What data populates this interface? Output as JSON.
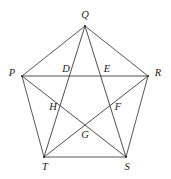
{
  "figure": {
    "type": "geometry-diagram",
    "background_color": "#ffffff",
    "line_color": "#3a3a3a",
    "label_color": "#1c1c1c",
    "width": 171,
    "height": 179,
    "vertices": [
      {
        "label": "Q",
        "x": 85,
        "y": 26,
        "label_x": 85,
        "label_y": 16
      },
      {
        "label": "R",
        "x": 148,
        "y": 76,
        "label_x": 158,
        "label_y": 74
      },
      {
        "label": "S",
        "x": 126,
        "y": 157,
        "label_x": 127,
        "label_y": 168
      },
      {
        "label": "T",
        "x": 44,
        "y": 157,
        "label_x": 45,
        "label_y": 168
      },
      {
        "label": "P",
        "x": 22,
        "y": 76,
        "label_x": 12,
        "label_y": 74
      }
    ],
    "intersections": [
      {
        "label": "D",
        "x": 73,
        "y": 77,
        "label_x": 66,
        "label_y": 70
      },
      {
        "label": "E",
        "x": 100,
        "y": 77,
        "label_x": 107,
        "label_y": 70
      },
      {
        "label": "F",
        "x": 110,
        "y": 109,
        "label_x": 118,
        "label_y": 108
      },
      {
        "label": "G",
        "x": 85,
        "y": 127,
        "label_x": 85,
        "label_y": 136
      },
      {
        "label": "H",
        "x": 61,
        "y": 109,
        "label_x": 53,
        "label_y": 108
      }
    ],
    "edges": [
      {
        "name": "edge-PQ",
        "from": "P",
        "to": "Q"
      },
      {
        "name": "edge-QR",
        "from": "Q",
        "to": "R"
      },
      {
        "name": "edge-RS",
        "from": "R",
        "to": "S"
      },
      {
        "name": "edge-ST",
        "from": "S",
        "to": "T"
      },
      {
        "name": "edge-TP",
        "from": "T",
        "to": "P"
      }
    ],
    "diagonals": [
      {
        "name": "diagonal-PR",
        "from": "P",
        "to": "R"
      },
      {
        "name": "diagonal-QS",
        "from": "Q",
        "to": "S"
      },
      {
        "name": "diagonal-QT",
        "from": "Q",
        "to": "T"
      },
      {
        "name": "diagonal-PS",
        "from": "P",
        "to": "S"
      },
      {
        "name": "diagonal-RT",
        "from": "R",
        "to": "T"
      }
    ]
  }
}
